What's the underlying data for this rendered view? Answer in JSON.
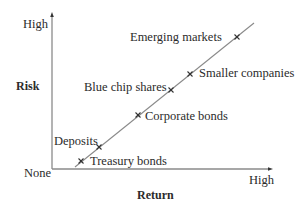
{
  "diagram": {
    "y_axis": {
      "title": "Risk",
      "high_label": "High",
      "origin_label": "None"
    },
    "x_axis": {
      "title": "Return",
      "high_label": "High"
    },
    "points": [
      {
        "label": "Treasury bonds",
        "x": 81,
        "y": 161
      },
      {
        "label": "Deposits",
        "x": 99,
        "y": 147
      },
      {
        "label": "Corporate bonds",
        "x": 138,
        "y": 115
      },
      {
        "label": "Blue chip shares",
        "x": 171,
        "y": 90
      },
      {
        "label": "Smaller companies",
        "x": 190,
        "y": 74
      },
      {
        "label": "Emerging markets",
        "x": 237,
        "y": 37
      }
    ],
    "colors": {
      "axis": "#8a8a8a",
      "line": "#8a8a8a",
      "marker": "#333333",
      "text": "#2b2b2b"
    }
  }
}
